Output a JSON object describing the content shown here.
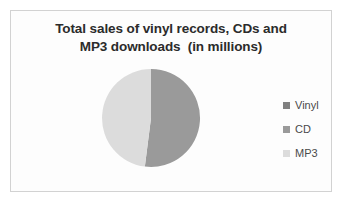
{
  "frame": {
    "background_color": "#fdfdfd",
    "border_color": "#d2d2d2"
  },
  "chart_data": {
    "type": "pie",
    "title": "Total sales of vinyl records, CDs and MP3 downloads (in millions)",
    "title_lines": [
      "Total sales of vinyl records, CDs and",
      "MP3 downloads  (in millions)"
    ],
    "categories": [
      "Vinyl",
      "CD",
      "MP3"
    ],
    "values": [
      0,
      52,
      48
    ],
    "units": "millions",
    "colors": [
      "#808080",
      "#9a9a9a",
      "#dcdcdc"
    ],
    "legend_position": "right",
    "grid": false,
    "start_angle_deg": 0,
    "slices": [
      {
        "label": "Vinyl",
        "value": 0,
        "percent": 0,
        "color": "#808080",
        "visible": false
      },
      {
        "label": "CD",
        "value": 52,
        "percent": 52,
        "color": "#9a9a9a",
        "visible": true
      },
      {
        "label": "MP3",
        "value": 48,
        "percent": 48,
        "color": "#dcdcdc",
        "visible": true
      }
    ]
  },
  "legend": {
    "items": [
      {
        "label": "Vinyl",
        "color": "#808080"
      },
      {
        "label": "CD",
        "color": "#9a9a9a"
      },
      {
        "label": "MP3",
        "color": "#dcdcdc"
      }
    ]
  }
}
